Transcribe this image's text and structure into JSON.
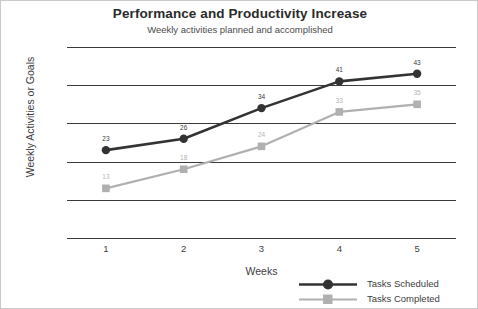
{
  "chart_data": {
    "type": "line",
    "title": "Performance and Productivity Increase",
    "subtitle": "Weekly activities planned and accomplished",
    "xlabel": "Weeks",
    "ylabel": "Weekly Activities or Goals",
    "categories": [
      "1",
      "2",
      "3",
      "4",
      "5"
    ],
    "yticks": [
      "0",
      "10",
      "20",
      "30",
      "40",
      "50"
    ],
    "ylim": [
      0,
      50
    ],
    "grid": "horizontal",
    "legend_position": "bottom-right",
    "series": [
      {
        "name": "Tasks Scheduled",
        "values": [
          23,
          26,
          34,
          41,
          43
        ],
        "color": "#333333",
        "marker": "circle"
      },
      {
        "name": "Tasks Completed",
        "values": [
          13,
          18,
          24,
          33,
          35
        ],
        "color": "#b0b0b0",
        "marker": "square"
      }
    ]
  }
}
